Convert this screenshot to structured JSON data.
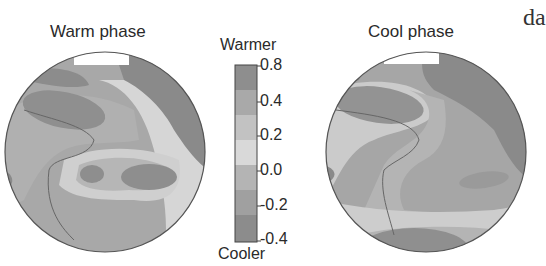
{
  "panels": [
    {
      "title": "Warm phase"
    },
    {
      "title": "Cool phase"
    }
  ],
  "colorbar": {
    "top_label": "Warmer",
    "bottom_label": "Cooler",
    "ticks": [
      "0.8",
      "0.4",
      "0.2",
      "0.0",
      "-0.2",
      "-0.4"
    ],
    "colors": [
      "#8e8e8e",
      "#a9a9a9",
      "#c2c2c2",
      "#d9d9d9",
      "#b4b4b4",
      "#a0a0a0",
      "#8c8c8c"
    ]
  },
  "page_fragment": "da",
  "palette": {
    "land": "#8a8a8a",
    "very_warm": "#8e8e8e",
    "warm": "#ababab",
    "neutral": "#c4c4c4",
    "light": "#dadada",
    "cool": "#a2a2a2",
    "outline": "#555555"
  }
}
